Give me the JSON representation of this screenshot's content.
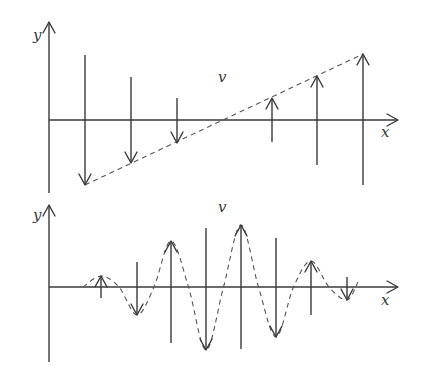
{
  "colors": {
    "ink": "#3a3a3a",
    "dash": "#555555",
    "background": "#ffffff"
  },
  "panels": [
    {
      "name": "linear-polarization-panel",
      "labels": {
        "y_axis": "y",
        "x_axis": "x",
        "velocity": "v"
      },
      "axis": {
        "origin_x": 49,
        "x_axis_y": 120,
        "y_top": 22,
        "y_bottom": 193,
        "x_right": 398
      },
      "label_pos": {
        "y": [
          33,
          28
        ],
        "x": [
          381,
          125
        ],
        "v": [
          218,
          70
        ]
      },
      "vectors": [
        {
          "x": 85,
          "from": 55,
          "to": 185
        },
        {
          "x": 131,
          "from": 77,
          "to": 163
        },
        {
          "x": 177,
          "from": 98,
          "to": 143
        },
        {
          "x": 272,
          "from": 142,
          "to": 98
        },
        {
          "x": 317,
          "from": 165,
          "to": 76
        },
        {
          "x": 363,
          "from": 185,
          "to": 54
        }
      ],
      "envelope": {
        "type": "line",
        "points": [
          [
            85,
            185
          ],
          [
            363,
            54
          ]
        ]
      }
    },
    {
      "name": "wave-packet-panel",
      "labels": {
        "y_axis": "y",
        "x_axis": "x",
        "velocity": "v"
      },
      "axis": {
        "origin_x": 49,
        "x_axis_y": 287,
        "y_top": 205,
        "y_bottom": 362,
        "x_right": 398
      },
      "label_pos": {
        "y": [
          33,
          208
        ],
        "x": [
          381,
          293
        ],
        "v": [
          218,
          200
        ]
      },
      "vectors": [
        {
          "x": 101,
          "from": 298,
          "to": 276
        },
        {
          "x": 137,
          "from": 262,
          "to": 315
        },
        {
          "x": 171,
          "from": 343,
          "to": 241
        },
        {
          "x": 206,
          "from": 228,
          "to": 350
        },
        {
          "x": 241,
          "from": 349,
          "to": 225
        },
        {
          "x": 276,
          "from": 238,
          "to": 337
        },
        {
          "x": 311,
          "from": 315,
          "to": 261
        },
        {
          "x": 347,
          "from": 277,
          "to": 300
        }
      ],
      "envelope": {
        "type": "curve",
        "start": [
          83,
          287
        ],
        "end": [
          358,
          282
        ]
      }
    }
  ]
}
